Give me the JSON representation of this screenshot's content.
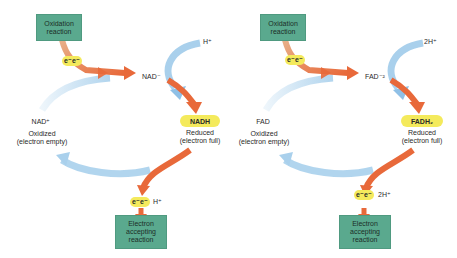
{
  "colors": {
    "reaction_box": "#5aa98e",
    "electron_pill": "#f4ea5c",
    "electron_arrow": "#e8693a",
    "cycle_arrow": "#a9d0ec"
  },
  "panels": [
    {
      "carrier": "NAD",
      "oxidation_box": "Oxidation reaction",
      "electrons_top": "e⁻e⁻",
      "intermediate": "NAD⁻",
      "proton_in": "H⁺",
      "reduced_form": "NADH",
      "reduced_state": "Reduced",
      "reduced_note": "(electron full)",
      "oxidized_form": "NAD⁺",
      "oxidized_state": "Oxidized",
      "oxidized_note": "(electron empty)",
      "electrons_bottom": "e⁻e⁻",
      "proton_out": "H⁺",
      "accepting_box": "Electron accepting reaction"
    },
    {
      "carrier": "FAD",
      "oxidation_box": "Oxidation reaction",
      "electrons_top": "e⁻e⁻",
      "intermediate": "FAD⁻²",
      "proton_in": "2H⁺",
      "reduced_form": "FADH₂",
      "reduced_state": "Reduced",
      "reduced_note": "(electron full)",
      "oxidized_form": "FAD",
      "oxidized_state": "Oxidized",
      "oxidized_note": "(electron empty)",
      "electrons_bottom": "e⁻e⁻",
      "proton_out": "2H⁺",
      "accepting_box": "Electron accepting reaction"
    }
  ]
}
